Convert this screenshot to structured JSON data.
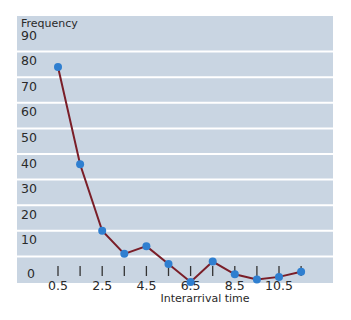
{
  "chart_data": {
    "type": "line",
    "title": "",
    "xlabel": "Interarrival time",
    "ylabel": "Frequency",
    "x": [
      0.5,
      1.5,
      2.5,
      3.5,
      4.5,
      5.5,
      6.5,
      7.5,
      8.5,
      9.5,
      10.5,
      11.5
    ],
    "series": [
      {
        "name": "Frequency",
        "values": [
          84,
          46,
          20,
          11,
          14,
          7,
          0,
          8,
          3,
          1,
          2,
          4
        ]
      }
    ],
    "x_tick_labels": [
      "0.5",
      "",
      "2.5",
      "",
      "4.5",
      "",
      "6.5",
      "",
      "8.5",
      "",
      "10.5",
      ""
    ],
    "y_ticks": [
      0,
      10,
      20,
      30,
      40,
      50,
      60,
      70,
      80,
      90
    ],
    "ylim": [
      0,
      100
    ],
    "grid": true,
    "legend": "none",
    "colors": {
      "background": "#c9d5e2",
      "gridline": "#ffffff",
      "line": "#7a1e28",
      "marker": "#2f7fd0"
    }
  }
}
